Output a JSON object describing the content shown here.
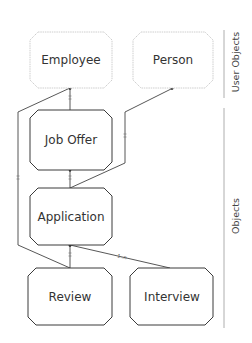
{
  "diagram": {
    "lanes": [
      {
        "id": "user-objects",
        "label": "User Objects"
      },
      {
        "id": "objects",
        "label": "Objects"
      }
    ],
    "nodes": [
      {
        "id": "employee",
        "label": "Employee",
        "lane": "user-objects",
        "style": "light"
      },
      {
        "id": "person",
        "label": "Person",
        "lane": "user-objects",
        "style": "light"
      },
      {
        "id": "job-offer",
        "label": "Job Offer",
        "lane": "objects",
        "style": "dark"
      },
      {
        "id": "application",
        "label": "Application",
        "lane": "objects",
        "style": "dark"
      },
      {
        "id": "review",
        "label": "Review",
        "lane": "objects",
        "style": "dark"
      },
      {
        "id": "interview",
        "label": "Interview",
        "lane": "objects",
        "style": "dark"
      }
    ],
    "edges": [
      {
        "from": "job-offer",
        "to": "employee",
        "multiplicity": "1"
      },
      {
        "from": "application",
        "to": "person",
        "multiplicity": "1"
      },
      {
        "from": "application",
        "to": "job-offer",
        "multiplicity": "1"
      },
      {
        "from": "review",
        "to": "employee",
        "multiplicity": "1"
      },
      {
        "from": "review",
        "to": "application",
        "multiplicity": "1"
      },
      {
        "from": "interview",
        "to": "application",
        "multiplicity": "1..n"
      }
    ],
    "colors": {
      "light_border": "#c8c8c8",
      "dark_border": "#3a3a3a",
      "edge": "#444444",
      "divider": "#9a9a9a"
    }
  }
}
